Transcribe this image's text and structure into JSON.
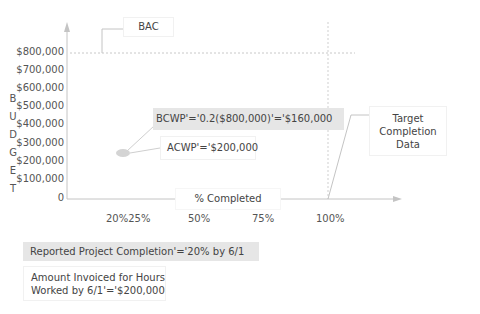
{
  "diagram": {
    "y_axis_letters": [
      "B",
      "U",
      "D",
      "G",
      "E",
      "T"
    ],
    "y_axis_label": "BUDGET",
    "y_ticks": [
      "$800,000",
      "$700,000",
      "$600,000",
      "$500,000",
      "$400,000",
      "$300,000",
      "$200,000",
      "$100,000",
      "0"
    ],
    "x_ticks": [
      "20%25%",
      "50%",
      "75%",
      "100%"
    ],
    "x_axis_label": "% Completed",
    "bac_label": "BAC",
    "bcwp_label": "BCWP'='0.2($800,000)'='$160,000",
    "acwp_label": "ACWP'='$200,000",
    "target_label": [
      "Target",
      "Completion",
      "Data"
    ],
    "reported_label": "Reported Project Completion'='20% by 6/1",
    "invoiced_label": [
      "Amount Invoiced for Hours",
      "Worked by 6/1'='$200,000"
    ],
    "colors": {
      "axis": "#bdbdbd",
      "dashed": "#c8c8c8",
      "highlight_box": "#e6e6e6",
      "point": "#d4d4d4",
      "text": "#4a4a4a"
    }
  }
}
